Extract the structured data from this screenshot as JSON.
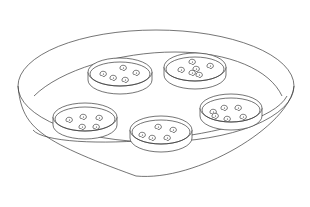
{
  "illustration": {
    "caption": "Large tray containing five petri dishes with seeds",
    "line_color": "#3a3a3a",
    "background_color": "#ffffff",
    "tray": {
      "rim": {
        "cx": 156,
        "cy": 86,
        "rx": 138,
        "ry": 56
      },
      "bottom": {
        "cx": 156,
        "cy": 130,
        "rx": 120,
        "ry": 50
      },
      "inner_floor": {
        "cx": 158,
        "cy": 100,
        "rx": 125,
        "ry": 48
      }
    },
    "dishes": [
      {
        "name": "dish-top-left",
        "cx": 120,
        "cy": 72,
        "rx": 32,
        "ry": 14,
        "depth": 8,
        "seed_count": 5,
        "seeds": [
          [
            103,
            74
          ],
          [
            113,
            78
          ],
          [
            123,
            68
          ],
          [
            125,
            80
          ],
          [
            136,
            73
          ]
        ]
      },
      {
        "name": "dish-top-right",
        "cx": 195,
        "cy": 67,
        "rx": 31,
        "ry": 14,
        "depth": 8,
        "seed_count": 6,
        "seeds": [
          [
            181,
            70
          ],
          [
            192,
            62
          ],
          [
            196,
            69
          ],
          [
            199,
            75
          ],
          [
            210,
            66
          ],
          [
            192,
            73
          ]
        ]
      },
      {
        "name": "dish-bottom-left",
        "cx": 85,
        "cy": 117,
        "rx": 32,
        "ry": 14,
        "depth": 8,
        "seed_count": 5,
        "seeds": [
          [
            69,
            120
          ],
          [
            83,
            117
          ],
          [
            99,
            118
          ],
          [
            82,
            127
          ],
          [
            96,
            127
          ]
        ]
      },
      {
        "name": "dish-bottom-center",
        "cx": 161,
        "cy": 130,
        "rx": 31,
        "ry": 14,
        "depth": 8,
        "seed_count": 5,
        "seeds": [
          [
            142,
            135
          ],
          [
            152,
            138
          ],
          [
            158,
            127
          ],
          [
            167,
            138
          ],
          [
            173,
            130
          ]
        ]
      },
      {
        "name": "dish-bottom-right",
        "cx": 231,
        "cy": 108,
        "rx": 31,
        "ry": 14,
        "depth": 8,
        "seed_count": 6,
        "seeds": [
          [
            213,
            112
          ],
          [
            224,
            108
          ],
          [
            238,
            108
          ],
          [
            227,
            119
          ],
          [
            243,
            117
          ],
          [
            215,
            116
          ]
        ]
      }
    ]
  }
}
